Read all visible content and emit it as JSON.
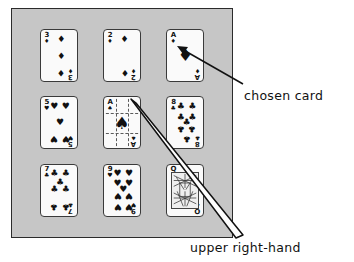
{
  "figure": {
    "panel_color": "#c6c6c6",
    "card_face_color": "#fafafa",
    "ink_color": "#111111"
  },
  "cards": [
    {
      "id": "card-3-diamonds",
      "rank": "3",
      "suit_name": "diamond",
      "suit_glyph": "♦",
      "position": "top-left",
      "pip_count": 3,
      "is_court": false,
      "is_reference": false,
      "is_chosen": false
    },
    {
      "id": "card-2-diamonds",
      "rank": "2",
      "suit_name": "diamond",
      "suit_glyph": "♦",
      "position": "top-center",
      "pip_count": 2,
      "is_court": false,
      "is_reference": false,
      "is_chosen": false
    },
    {
      "id": "card-ace-diamonds",
      "rank": "A",
      "suit_name": "diamond",
      "suit_glyph": "♦",
      "position": "top-right",
      "pip_count": 1,
      "is_court": false,
      "is_reference": false,
      "is_chosen": true
    },
    {
      "id": "card-5-hearts",
      "rank": "5",
      "suit_name": "heart",
      "suit_glyph": "♥",
      "position": "middle-left",
      "pip_count": 5,
      "is_court": false,
      "is_reference": false,
      "is_chosen": false
    },
    {
      "id": "card-ace-spades",
      "rank": "A",
      "suit_name": "spade",
      "suit_glyph": "♠",
      "position": "middle-center",
      "pip_count": 1,
      "is_court": false,
      "is_reference": true,
      "is_chosen": false
    },
    {
      "id": "card-8-clubs",
      "rank": "8",
      "suit_name": "club",
      "suit_glyph": "♣",
      "position": "middle-right",
      "pip_count": 8,
      "is_court": false,
      "is_reference": false,
      "is_chosen": false
    },
    {
      "id": "card-7-clubs",
      "rank": "7",
      "suit_name": "club",
      "suit_glyph": "♣",
      "position": "bottom-left",
      "pip_count": 7,
      "is_court": false,
      "is_reference": false,
      "is_chosen": false
    },
    {
      "id": "card-9-hearts",
      "rank": "9",
      "suit_name": "heart",
      "suit_glyph": "♥",
      "position": "bottom-center",
      "pip_count": 9,
      "is_court": false,
      "is_reference": false,
      "is_chosen": false
    },
    {
      "id": "card-queen-spades",
      "rank": "Q",
      "suit_name": "spade",
      "suit_glyph": "♠",
      "position": "bottom-right",
      "pip_count": 0,
      "is_court": true,
      "is_reference": false,
      "is_chosen": false
    }
  ],
  "annotations": {
    "chosen_card_label": "chosen card",
    "upper_right_hand_label": "upper right-hand"
  }
}
